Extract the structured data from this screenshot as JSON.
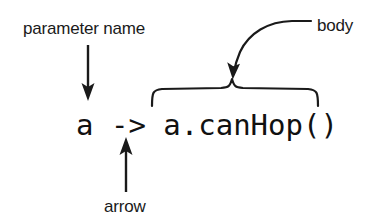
{
  "figure": {
    "background_color": "#ffffff",
    "ink_color": "#1a1a1a",
    "width": 371,
    "height": 224
  },
  "code": {
    "full_text": "a -> a.canHop()",
    "parameter_name": "a",
    "arrow_token": "->",
    "body_text": "a.canHop()"
  },
  "annotations": {
    "parameter_name_label": "parameter name",
    "body_label": "body",
    "arrow_label": "arrow"
  },
  "connectors": {
    "parameter_name_pointer": "down-arrow",
    "arrow_pointer": "up-arrow",
    "body_pointer": "curved-arrow",
    "body_grouping": "curly-brace"
  }
}
